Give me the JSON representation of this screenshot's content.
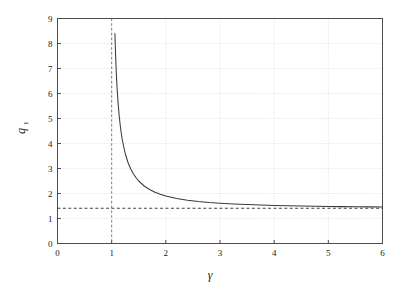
{
  "chart_data": {
    "type": "line",
    "title": "",
    "xlabel": "γ",
    "ylabel": "q₁",
    "xlim": [
      0,
      6
    ],
    "ylim": [
      0,
      9
    ],
    "xticks": [
      0,
      1,
      2,
      3,
      4,
      5,
      6
    ],
    "yticks": [
      0,
      1,
      2,
      3,
      4,
      5,
      6,
      7,
      8,
      9
    ],
    "xtick_labels": [
      "0",
      "1",
      "2",
      "3",
      "4",
      "5",
      "6"
    ],
    "ytick_labels": [
      "0",
      "1",
      "2",
      "3",
      "4",
      "5",
      "6",
      "7",
      "8",
      "9"
    ],
    "grid": true,
    "grid_style": "dotted",
    "legend": null,
    "series": [
      {
        "name": "q1",
        "style": "solid",
        "color": "#3a3a3a",
        "x": [
          1.06,
          1.07,
          1.08,
          1.09,
          1.1,
          1.12,
          1.14,
          1.16,
          1.18,
          1.2,
          1.25,
          1.3,
          1.35,
          1.4,
          1.45,
          1.5,
          1.6,
          1.7,
          1.8,
          1.9,
          2.0,
          2.2,
          2.4,
          2.6,
          2.8,
          3.0,
          3.25,
          3.5,
          3.75,
          4.0,
          4.25,
          4.5,
          4.75,
          5.0,
          5.25,
          5.5,
          5.75,
          6.0
        ],
        "y": [
          8.4,
          7.7,
          7.1,
          6.62,
          6.22,
          5.58,
          5.08,
          4.69,
          4.37,
          4.1,
          3.6,
          3.25,
          2.99,
          2.79,
          2.63,
          2.5,
          2.3,
          2.16,
          2.05,
          1.97,
          1.9,
          1.8,
          1.73,
          1.68,
          1.64,
          1.61,
          1.58,
          1.56,
          1.54,
          1.52,
          1.51,
          1.5,
          1.49,
          1.48,
          1.475,
          1.47,
          1.465,
          1.46
        ]
      }
    ],
    "reference_lines": [
      {
        "name": "horizontal-asymptote",
        "orientation": "horizontal",
        "value": 1.41,
        "style": "dashed",
        "color": "#2b2b2b"
      },
      {
        "name": "vertical-asymptote",
        "orientation": "vertical",
        "value": 1.0,
        "style": "dashed",
        "color": "#6e6e6e"
      }
    ],
    "colors": {
      "axis": "#4d4d4d",
      "grid": "#d9d9d9",
      "curve": "#3a3a3a",
      "dash": "#2b2b2b",
      "background": "#ffffff",
      "text": "#1a1a1a"
    }
  }
}
